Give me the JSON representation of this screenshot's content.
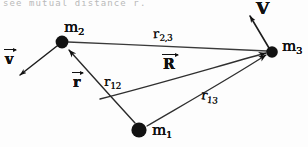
{
  "figure": {
    "kind": "hand-drawn-physics-diagram",
    "topic": "three-body mutual distances and velocities",
    "width": 308,
    "height": 147,
    "background_color": "#fdfdfd",
    "ink_color": "#111111",
    "cropped_caption_above": "see mutual distance r."
  },
  "masses": [
    {
      "id": "m1",
      "label": "m",
      "subscript": "1",
      "x": 139,
      "y": 130,
      "radius": 7.5,
      "label_x": 152,
      "label_y": 124
    },
    {
      "id": "m2",
      "label": "m",
      "subscript": "2",
      "x": 62,
      "y": 42,
      "radius": 6.5,
      "label_x": 64,
      "label_y": 21
    },
    {
      "id": "m3",
      "label": "m",
      "subscript": "3",
      "x": 272,
      "y": 52,
      "radius": 6.0,
      "label_x": 282,
      "label_y": 40
    }
  ],
  "distance_labels": [
    {
      "id": "r23",
      "symbol": "r",
      "subscript": "2,3",
      "x": 153,
      "y": 28,
      "rotation": -2,
      "between": "m2-m3"
    },
    {
      "id": "r12",
      "symbol": "r",
      "subscript": "12",
      "x": 103,
      "y": 76,
      "rotation": 0,
      "between": "m1-m2"
    },
    {
      "id": "r13",
      "symbol": "r",
      "subscript": "13",
      "x": 201,
      "y": 90,
      "rotation": 6,
      "between": "m1-m3"
    }
  ],
  "vector_labels": [
    {
      "id": "r-vector",
      "symbol": "r",
      "x": 73,
      "y": 76,
      "size": "normal",
      "description": "separation vector from m1 toward m2"
    },
    {
      "id": "R-vector",
      "symbol": "R",
      "x": 163,
      "y": 57,
      "size": "normal",
      "description": "center-of-mass to m3 vector"
    },
    {
      "id": "v-vector",
      "symbol": "v",
      "x": 4,
      "y": 52,
      "size": "normal",
      "description": "velocity of m2"
    },
    {
      "id": "V-vector",
      "symbol": "V",
      "x": 255,
      "y": 0,
      "size": "big",
      "description": "velocity of m3"
    }
  ],
  "segments": [
    {
      "id": "seg-m2-m3",
      "from": "m2",
      "to": "m3",
      "x1": 68,
      "y1": 42,
      "x2": 267,
      "y2": 51,
      "arrowhead": "none"
    },
    {
      "id": "seg-m1-m2",
      "from": "m1",
      "to": "m2",
      "x1": 135,
      "y1": 123,
      "x2": 67,
      "y2": 48,
      "arrowhead": "at-m2"
    },
    {
      "id": "seg-m1-m3",
      "from": "m1",
      "to": "m3",
      "x1": 146,
      "y1": 126,
      "x2": 267,
      "y2": 54,
      "arrowhead": "at-m3"
    },
    {
      "id": "seg-mid-m3",
      "from": "midpoint",
      "to": "m3",
      "x1": 107,
      "y1": 96,
      "x2": 267,
      "y2": 53,
      "arrowhead": "at-m3"
    },
    {
      "id": "seg-v-m2",
      "from": "m2",
      "to": "v-tip",
      "x1": 58,
      "y1": 46,
      "x2": 18,
      "y2": 76,
      "arrowhead": "at-tip"
    },
    {
      "id": "seg-V-m3",
      "from": "m3",
      "to": "V-tip",
      "x1": 268,
      "y1": 48,
      "x2": 249,
      "y2": 14,
      "arrowhead": "at-tip"
    }
  ],
  "midpoint_marker": {
    "id": "midpoint",
    "x": 107,
    "y": 96
  }
}
